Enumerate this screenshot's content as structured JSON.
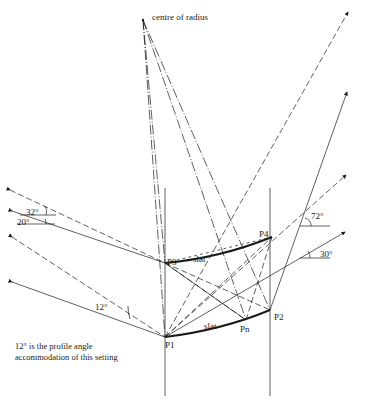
{
  "labels": {
    "centre": "centre of radius",
    "p1": "P1",
    "p2": "P2",
    "p3": "P3",
    "p4": "P4",
    "pn": "Pn",
    "slat_top": "slat",
    "slat_bottom": "slat",
    "angle_32": "32°",
    "angle_20": "20°",
    "angle_12": "12°",
    "angle_72": "72°",
    "angle_30": "30°"
  },
  "note": {
    "line1": "12° is the profile angle",
    "line2": "accommodation of this setting"
  },
  "points": {
    "centre": [
      143,
      20
    ],
    "P1": [
      165,
      337
    ],
    "P2": [
      270,
      310
    ],
    "P3": [
      165,
      263
    ],
    "P4": [
      272,
      237
    ],
    "Pn": [
      246,
      320
    ]
  },
  "colors": {
    "ink": "#1a1a1a",
    "background": "#ffffff"
  }
}
